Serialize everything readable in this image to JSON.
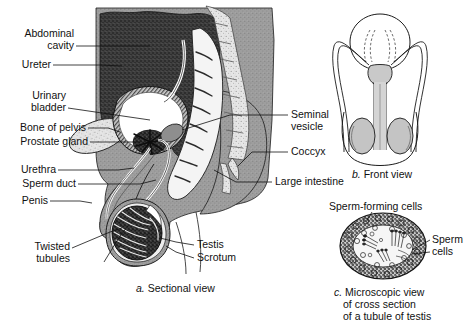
{
  "figure": {
    "background": "#ffffff",
    "ink": "#111111"
  },
  "panels": {
    "a": {
      "caption_label": "a.",
      "caption_text": "Sectional view",
      "labels_left": [
        {
          "id": "abdominal-cavity",
          "lines": [
            "Abdominal",
            "cavity"
          ]
        },
        {
          "id": "ureter",
          "lines": [
            "Ureter"
          ]
        },
        {
          "id": "urinary-bladder",
          "lines": [
            "Urinary",
            "bladder"
          ]
        },
        {
          "id": "bone-of-pelvis",
          "lines": [
            "Bone of pelvis"
          ]
        },
        {
          "id": "prostate-gland",
          "lines": [
            "Prostate gland"
          ]
        },
        {
          "id": "urethra",
          "lines": [
            "Urethra"
          ]
        },
        {
          "id": "sperm-duct",
          "lines": [
            "Sperm duct"
          ]
        },
        {
          "id": "penis",
          "lines": [
            "Penis"
          ]
        },
        {
          "id": "twisted-tubules",
          "lines": [
            "Twisted",
            "tubules"
          ]
        }
      ],
      "labels_right": [
        {
          "id": "seminal-vesicle",
          "lines": [
            "Seminal",
            "vesicle"
          ]
        },
        {
          "id": "coccyx",
          "lines": [
            "Coccyx"
          ]
        },
        {
          "id": "large-intestine",
          "lines": [
            "Large intestine"
          ]
        },
        {
          "id": "testis",
          "lines": [
            "Testis"
          ]
        },
        {
          "id": "scrotum",
          "lines": [
            "Scrotum"
          ]
        }
      ]
    },
    "b": {
      "caption_label": "b.",
      "caption_text": "Front view"
    },
    "c": {
      "caption_label": "c.",
      "caption_lines": [
        "Microscopic view",
        "of cross section",
        "of a tubule of testis"
      ],
      "labels": [
        {
          "id": "sperm-forming-cells",
          "lines": [
            "Sperm-forming cells"
          ]
        },
        {
          "id": "sperm-cells",
          "lines": [
            "Sperm",
            "cells"
          ]
        }
      ]
    }
  },
  "colors": {
    "abdominal_cavity": "#3a3a3a",
    "soft_tissue": "#9a9a9a",
    "bone": "#d8d8d8",
    "bladder_lumen": "#ffffff",
    "prostate": "#2b2b2b",
    "intestine": "#f2f2f2",
    "testis": "#2f2f2f",
    "tubule_ring": "#4a4a4a",
    "line": "#111111"
  }
}
